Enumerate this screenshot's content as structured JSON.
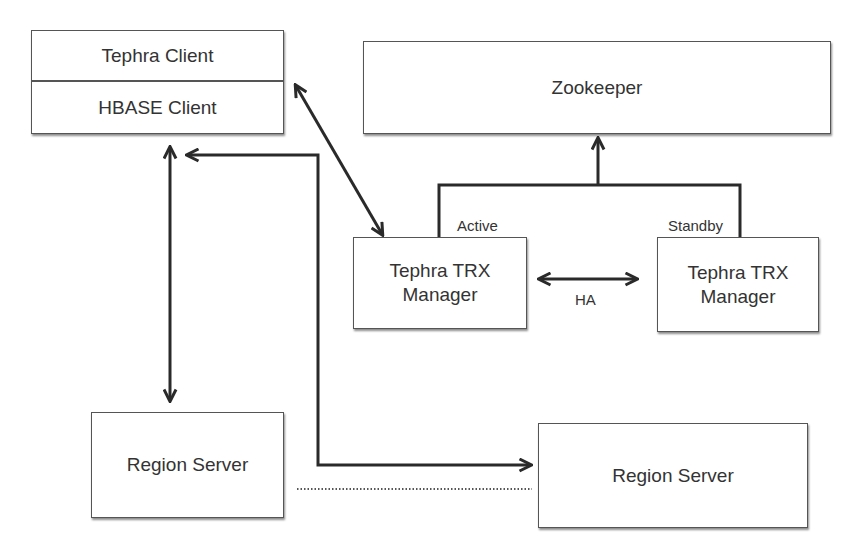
{
  "diagram": {
    "client_stack": {
      "top_label": "Tephra Client",
      "bottom_label": "HBASE Client"
    },
    "zookeeper": {
      "label": "Zookeeper"
    },
    "trx_active": {
      "line1": "Tephra TRX",
      "line2": "Manager",
      "role": "Active"
    },
    "trx_standby": {
      "line1": "Tephra TRX",
      "line2": "Manager",
      "role": "Standby"
    },
    "ha_label": "HA",
    "region_server_left": {
      "label": "Region Server"
    },
    "region_server_right": {
      "label": "Region Server"
    },
    "connections": [
      {
        "from": "Tephra Client",
        "to": "Tephra TRX Manager (Active)",
        "type": "bidirectional"
      },
      {
        "from": "HBASE Client",
        "to": "Region Server (left)",
        "type": "bidirectional"
      },
      {
        "from": "HBASE Client",
        "to": "Region Server (right)",
        "type": "bidirectional-elbow"
      },
      {
        "from": "Tephra TRX Manager (Active)",
        "to": "Zookeeper",
        "type": "merged-arrow"
      },
      {
        "from": "Tephra TRX Manager (Standby)",
        "to": "Zookeeper",
        "type": "merged-arrow"
      },
      {
        "from": "Tephra TRX Manager (Active)",
        "to": "Tephra TRX Manager (Standby)",
        "type": "bidirectional",
        "label": "HA"
      },
      {
        "from": "Region Server (left)",
        "to": "Region Server (right)",
        "type": "dotted"
      }
    ],
    "colors": {
      "line": "#2a2a2a",
      "border": "#555555",
      "text": "#333333",
      "background": "#ffffff"
    }
  }
}
